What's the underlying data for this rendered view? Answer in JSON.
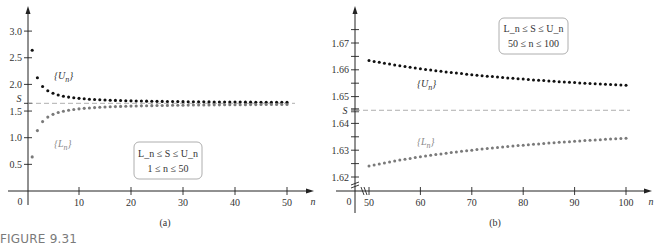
{
  "figure": {
    "caption": "FIGURE 9.31",
    "colors": {
      "upper": "#111111",
      "lower": "#7a7a7a",
      "axis": "#222222",
      "dashed": "#9a9a9a",
      "box_border": "#9a9a9a"
    }
  },
  "chart_data": [
    {
      "type": "scatter",
      "panel_label": "(a)",
      "xlabel": "n",
      "ylabel": "",
      "xlim": [
        0,
        50
      ],
      "ylim": [
        0,
        3.0
      ],
      "x_ticks": [
        10,
        20,
        30,
        40,
        50
      ],
      "x_tick_labels": [
        "10",
        "20",
        "30",
        "40",
        "50"
      ],
      "y_ticks": [
        0.5,
        1.0,
        1.5,
        2.0,
        2.5,
        3.0
      ],
      "y_tick_labels": [
        "0.5",
        "1.0",
        "1.5",
        "2.0",
        "2.5",
        "3.0"
      ],
      "origin_label": "0",
      "reference_line": {
        "label": "S",
        "value": 1.6449,
        "style": "dashed"
      },
      "annotation": {
        "line1": "L_n ≤ S ≤ U_n",
        "line2": "1 ≤ n ≤ 50"
      },
      "series": [
        {
          "name": "{U_n}",
          "label_main": "{U",
          "label_sub": "n",
          "label_close": "}",
          "n_start": 1,
          "n_end": 50,
          "formula": "S + 0.929/(n - 0.0666)"
        },
        {
          "name": "{L_n}",
          "label_main": "{L",
          "label_sub": "n",
          "label_close": "}",
          "n_start": 1,
          "n_end": 50,
          "formula": "S - 1.042/(n + 0.0369)"
        }
      ],
      "grid": false,
      "legend": "inline labels"
    },
    {
      "type": "scatter",
      "panel_label": "(b)",
      "xlabel": "n",
      "ylabel": "",
      "xlim": [
        50,
        100
      ],
      "ylim": [
        1.62,
        1.67
      ],
      "x_ticks": [
        50,
        60,
        70,
        80,
        90,
        100
      ],
      "x_tick_labels": [
        "50",
        "60",
        "70",
        "80",
        "90",
        "100"
      ],
      "y_ticks": [
        1.62,
        1.63,
        1.64,
        1.65,
        1.66,
        1.67
      ],
      "y_tick_labels": [
        "1.62",
        "1.63",
        "1.64",
        "1.65",
        "1.66",
        "1.67"
      ],
      "origin_label": "0",
      "axis_break": true,
      "reference_line": {
        "label": "S",
        "value": 1.6449,
        "style": "dashed"
      },
      "annotation": {
        "line1": "L_n ≤ S ≤ U_n",
        "line2": "50 ≤ n ≤ 100"
      },
      "series": [
        {
          "name": "{U_n}",
          "label_main": "{U",
          "label_sub": "n",
          "label_close": "}",
          "n_start": 50,
          "n_end": 100,
          "formula": "S + 0.929/(n - 0.0666)",
          "approx_range": [
            1.6636,
            1.6542
          ]
        },
        {
          "name": "{L_n}",
          "label_main": "{L",
          "label_sub": "n",
          "label_close": "}",
          "n_start": 50,
          "n_end": 100,
          "formula": "S - 1.042/(n + 0.0369)",
          "approx_range": [
            1.624,
            1.6345
          ]
        }
      ],
      "grid": false,
      "legend": "inline labels"
    }
  ],
  "params": {
    "S": 1.6449,
    "U_a": 0.929,
    "U_b": -0.0666,
    "L_c": 1.042,
    "L_d": 0.0369
  }
}
